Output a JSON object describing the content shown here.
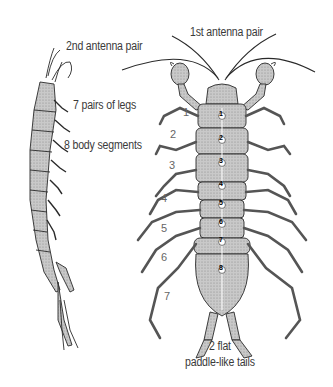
{
  "diagram": {
    "views": [
      "side view",
      "top view"
    ],
    "labels": {
      "antenna1": "1st antenna pair",
      "antenna2": "2nd antenna pair",
      "legs": "7 pairs of legs",
      "segments": "8 body segments",
      "tails_line1": "2 flat",
      "tails_line2": "paddle-like tails"
    },
    "leg_numbers": [
      "1",
      "2",
      "3",
      "4",
      "5",
      "6",
      "7"
    ],
    "segment_numbers": [
      "1",
      "2",
      "3",
      "4",
      "5",
      "6",
      "7",
      "8"
    ],
    "colors": {
      "ink": "#2a2a2a",
      "body_fill": "#bdbdbd",
      "label_text": "#3a3a3a"
    }
  }
}
